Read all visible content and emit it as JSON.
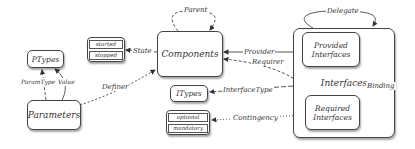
{
  "nodes": {
    "components": "Components",
    "state_values": [
      "started",
      "stopped"
    ],
    "ptypes": "PTypes",
    "parameters": "Parameters",
    "itypes": "ITypes",
    "contingency_values": [
      "optional",
      "mandatory"
    ],
    "interfaces": "Interfaces",
    "provided": "Provided Interfaces",
    "required": "Required Interfaces"
  },
  "edges": {
    "parent": "Parent",
    "state": "State",
    "param_type": "ParamType",
    "value": "Value",
    "definer": "Definer",
    "provider": "Provider",
    "requirer": "Requirer",
    "interface_type": "InterfaceType",
    "contingency": "Contingency",
    "delegate": "Delegate",
    "binding": "Binding"
  }
}
